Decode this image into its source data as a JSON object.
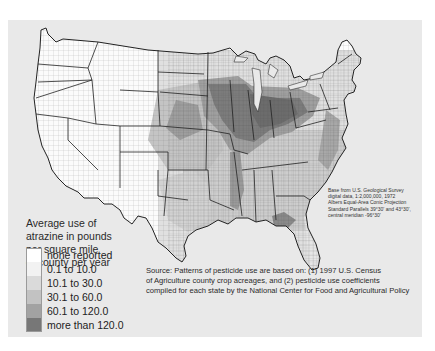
{
  "map": {
    "subject": "Average use of atrazine by county, conterminous United States",
    "background_color": "#e9e9e9",
    "border_color": "#333333"
  },
  "legend": {
    "title_lines": [
      "Average use of",
      "atrazine in pounds",
      "per square mile",
      "of county per year"
    ],
    "items": [
      {
        "label": "none reported",
        "color": "#ffffff"
      },
      {
        "label": "0.1 to 10.0",
        "color": "#f2f2f2"
      },
      {
        "label": "10.1 to 30.0",
        "color": "#dadada"
      },
      {
        "label": "30.1 to 60.0",
        "color": "#c2c2c2"
      },
      {
        "label": "60.1 to 120.0",
        "color": "#a2a2a2"
      },
      {
        "label": "more than 120.0",
        "color": "#777777"
      }
    ]
  },
  "base_note": {
    "lines": [
      "Base from U.S. Geological Survey",
      "digital data, 1:2,000,000, 1972",
      "Albers Equal-Area Conic Projection",
      "Standard Parallels 39°30' and 43°30',",
      "central meridian  -96°30'"
    ]
  },
  "source": {
    "lines": [
      "Source: Patterns of pesticide use are based on: (1) 1997 U.S. Census",
      "of Agriculture county crop acreages, and (2) pesticide use coefficients",
      "compiled for each state by the National Center for Food and Agricultural Policy"
    ]
  }
}
